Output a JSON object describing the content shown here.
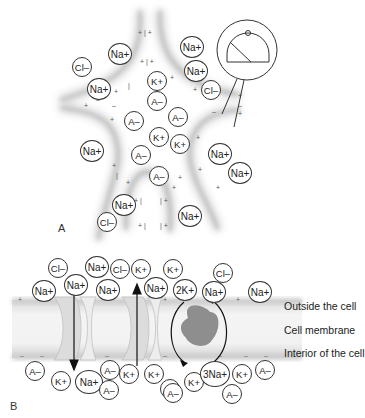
{
  "panel_a": {
    "label": "A",
    "ions": [
      {
        "text": "Cl–",
        "x": 72,
        "y": 57,
        "size": "sm"
      },
      {
        "text": "Na+",
        "x": 108,
        "y": 43,
        "size": "md"
      },
      {
        "text": "Na+",
        "x": 87,
        "y": 78,
        "size": "md"
      },
      {
        "text": "Na+",
        "x": 180,
        "y": 36,
        "size": "md"
      },
      {
        "text": "Na+",
        "x": 184,
        "y": 60,
        "size": "md"
      },
      {
        "text": "Cl–",
        "x": 201,
        "y": 80,
        "size": "sm"
      },
      {
        "text": "K+",
        "x": 147,
        "y": 71,
        "size": "sm"
      },
      {
        "text": "A–",
        "x": 147,
        "y": 91,
        "size": "sm"
      },
      {
        "text": "A–",
        "x": 124,
        "y": 111,
        "size": "sm"
      },
      {
        "text": "A–",
        "x": 168,
        "y": 107,
        "size": "sm"
      },
      {
        "text": "K+",
        "x": 149,
        "y": 127,
        "size": "sm"
      },
      {
        "text": "K+",
        "x": 170,
        "y": 134,
        "size": "sm"
      },
      {
        "text": "Na+",
        "x": 80,
        "y": 140,
        "size": "md"
      },
      {
        "text": "A–",
        "x": 131,
        "y": 145,
        "size": "sm"
      },
      {
        "text": "A–",
        "x": 149,
        "y": 166,
        "size": "sm"
      },
      {
        "text": "Na+",
        "x": 208,
        "y": 143,
        "size": "md"
      },
      {
        "text": "Na+",
        "x": 228,
        "y": 162,
        "size": "md"
      },
      {
        "text": "Na+",
        "x": 112,
        "y": 194,
        "size": "md"
      },
      {
        "text": "Cl–",
        "x": 97,
        "y": 212,
        "size": "sm"
      },
      {
        "text": "Na+",
        "x": 178,
        "y": 205,
        "size": "md"
      }
    ],
    "voltmeter_icon": "voltmeter-gauge-icon"
  },
  "panel_b": {
    "label": "B",
    "side_labels": {
      "outside": "Outside the cell",
      "membrane": "Cell membrane",
      "interior": "Interior of the cell"
    },
    "outside_ions": [
      {
        "text": "Cl–",
        "x": 48,
        "y": 258,
        "size": "sm"
      },
      {
        "text": "Na+",
        "x": 32,
        "y": 280,
        "size": "md"
      },
      {
        "text": "Na+",
        "x": 85,
        "y": 256,
        "size": "md"
      },
      {
        "text": "Na+",
        "x": 64,
        "y": 274,
        "size": "md"
      },
      {
        "text": "Cl–",
        "x": 110,
        "y": 259,
        "size": "sm"
      },
      {
        "text": "K+",
        "x": 131,
        "y": 259,
        "size": "sm"
      },
      {
        "text": "Na+",
        "x": 96,
        "y": 279,
        "size": "md"
      },
      {
        "text": "K+",
        "x": 163,
        "y": 259,
        "size": "sm"
      },
      {
        "text": "Na+",
        "x": 144,
        "y": 277,
        "size": "md"
      },
      {
        "text": "2K+",
        "x": 173,
        "y": 279,
        "size": "md"
      },
      {
        "text": "Cl–",
        "x": 213,
        "y": 263,
        "size": "sm"
      },
      {
        "text": "Na+",
        "x": 202,
        "y": 281,
        "size": "md"
      },
      {
        "text": "Na+",
        "x": 248,
        "y": 281,
        "size": "md"
      }
    ],
    "inside_ions": [
      {
        "text": "A–",
        "x": 25,
        "y": 361,
        "size": "sm"
      },
      {
        "text": "K+",
        "x": 51,
        "y": 371,
        "size": "sm"
      },
      {
        "text": "Na+",
        "x": 75,
        "y": 370,
        "size": "lg"
      },
      {
        "text": "A–",
        "x": 100,
        "y": 360,
        "size": "sm"
      },
      {
        "text": "A–",
        "x": 99,
        "y": 380,
        "size": "sm"
      },
      {
        "text": "K+",
        "x": 119,
        "y": 364,
        "size": "sm"
      },
      {
        "text": "K+",
        "x": 144,
        "y": 364,
        "size": "sm"
      },
      {
        "text": "A–",
        "x": 160,
        "y": 379,
        "size": "sm"
      },
      {
        "text": "K+",
        "x": 184,
        "y": 372,
        "size": "sm"
      },
      {
        "text": "A–",
        "x": 163,
        "y": 383,
        "size": "sm"
      },
      {
        "text": "3Na+",
        "x": 200,
        "y": 361,
        "size": "xl"
      },
      {
        "text": "K+",
        "x": 232,
        "y": 364,
        "size": "sm"
      },
      {
        "text": "A–",
        "x": 222,
        "y": 384,
        "size": "sm"
      },
      {
        "text": "A–",
        "x": 255,
        "y": 360,
        "size": "sm"
      }
    ],
    "channels": [
      "na-channel",
      "k-channel"
    ],
    "pump": "sodium-potassium-pump"
  }
}
